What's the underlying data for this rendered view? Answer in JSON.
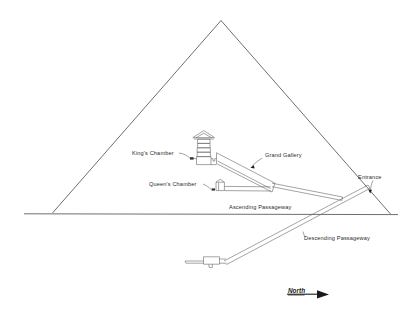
{
  "figure": {
    "labels": {
      "kings_chamber": "King's Chamber",
      "queens_chamber": "Queen's Chamber",
      "grand_gallery": "Grand Gallery",
      "entrance": "Entrance",
      "ascending_passageway": "Ascending Passageway",
      "descending_passageway": "Descending Passageway",
      "compass_north": "North"
    },
    "colors": {
      "background": "#ffffff",
      "outline": "#4a4a4a",
      "detail": "#666666",
      "text": "#2b2b2b",
      "compass_arrow": "#1a1a1a"
    },
    "structures": [
      "pyramid-outline",
      "ground-line",
      "kings-chamber",
      "relieving-chambers",
      "gabled-roof",
      "grand-gallery",
      "queens-chamber",
      "horizontal-passage",
      "ascending-passageway",
      "descending-passageway",
      "subterranean-chamber",
      "compass-indicator"
    ]
  }
}
